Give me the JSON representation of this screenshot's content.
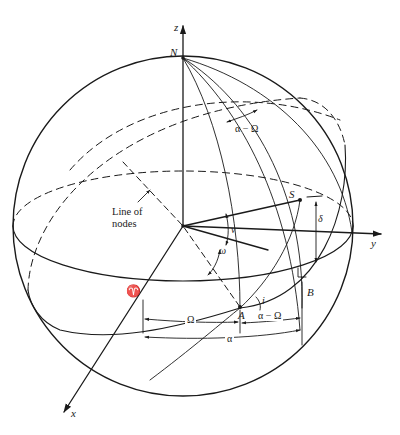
{
  "figure": {
    "stroke_color": "#1a1a1a",
    "background": "#ffffff"
  },
  "axes": {
    "z": "z",
    "y": "y",
    "x": "x"
  },
  "points": {
    "north_pole": "N",
    "satellite": "S",
    "ascending_node": "A",
    "foot_point": "B",
    "vernal_equinox": "♈"
  },
  "angles": {
    "alpha_minus_omega_top": "α − Ω",
    "nu": "ν",
    "omega": "ω",
    "inclination": "i",
    "delta": "δ",
    "Omega": "Ω",
    "alpha_minus_omega_bottom": "α − Ω",
    "alpha": "α"
  },
  "annotations": {
    "line_of_nodes_line1": "Line of",
    "line_of_nodes_line2": "nodes"
  }
}
